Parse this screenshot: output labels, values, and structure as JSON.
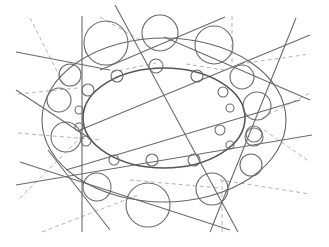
{
  "diagram": {
    "title": "",
    "inner_ellipse": {
      "cx": 164,
      "cy": 118,
      "rx": 81,
      "ry": 50
    },
    "outer_ellipse": {
      "cx": 164,
      "cy": 120,
      "rx": 122,
      "ry": 82
    },
    "solid_lines": [
      {
        "x1": 82,
        "y1": 16,
        "x2": 82,
        "y2": 232
      },
      {
        "x1": 16,
        "y1": 52,
        "x2": 110,
        "y2": 70
      },
      {
        "x1": 16,
        "y1": 90,
        "x2": 92,
        "y2": 140
      },
      {
        "x1": 16,
        "y1": 185,
        "x2": 312,
        "y2": 135
      },
      {
        "x1": 48,
        "y1": 150,
        "x2": 110,
        "y2": 230
      },
      {
        "x1": 100,
        "y1": 70,
        "x2": 225,
        "y2": 17
      },
      {
        "x1": 80,
        "y1": 130,
        "x2": 310,
        "y2": 35
      },
      {
        "x1": 66,
        "y1": 170,
        "x2": 300,
        "y2": 100
      },
      {
        "x1": 115,
        "y1": 5,
        "x2": 238,
        "y2": 232
      },
      {
        "x1": 210,
        "y1": 232,
        "x2": 296,
        "y2": 18
      },
      {
        "x1": 20,
        "y1": 162,
        "x2": 230,
        "y2": 230
      },
      {
        "x1": 164,
        "y1": 37,
        "x2": 310,
        "y2": 100
      }
    ],
    "dashed_lines": [
      {
        "x1": 30,
        "y1": 18,
        "x2": 64,
        "y2": 85
      },
      {
        "x1": 18,
        "y1": 94,
        "x2": 78,
        "y2": 88
      },
      {
        "x1": 100,
        "y1": 17,
        "x2": 140,
        "y2": 40
      },
      {
        "x1": 232,
        "y1": 16,
        "x2": 232,
        "y2": 62
      },
      {
        "x1": 240,
        "y1": 64,
        "x2": 310,
        "y2": 54
      },
      {
        "x1": 262,
        "y1": 118,
        "x2": 310,
        "y2": 93
      },
      {
        "x1": 82,
        "y1": 136,
        "x2": 18,
        "y2": 200
      },
      {
        "x1": 18,
        "y1": 133,
        "x2": 100,
        "y2": 140
      },
      {
        "x1": 42,
        "y1": 232,
        "x2": 138,
        "y2": 195
      },
      {
        "x1": 220,
        "y1": 180,
        "x2": 310,
        "y2": 194
      },
      {
        "x1": 222,
        "y1": 232,
        "x2": 222,
        "y2": 180
      },
      {
        "x1": 264,
        "y1": 130,
        "x2": 310,
        "y2": 162
      },
      {
        "x1": 130,
        "y1": 180,
        "x2": 220,
        "y2": 188
      },
      {
        "x1": 112,
        "y1": 72,
        "x2": 156,
        "y2": 63
      },
      {
        "x1": 186,
        "y1": 64,
        "x2": 224,
        "y2": 70
      }
    ],
    "circles": [
      {
        "cx": 106,
        "cy": 43,
        "r": 22
      },
      {
        "cx": 160,
        "cy": 33,
        "r": 18
      },
      {
        "cx": 214,
        "cy": 45,
        "r": 19
      },
      {
        "cx": 70,
        "cy": 75,
        "r": 11
      },
      {
        "cx": 59,
        "cy": 100,
        "r": 12
      },
      {
        "cx": 117,
        "cy": 76,
        "r": 6
      },
      {
        "cx": 156,
        "cy": 66,
        "r": 7
      },
      {
        "cx": 197,
        "cy": 76,
        "r": 6
      },
      {
        "cx": 88,
        "cy": 90,
        "r": 6
      },
      {
        "cx": 79,
        "cy": 110,
        "r": 4
      },
      {
        "cx": 242,
        "cy": 77,
        "r": 12
      },
      {
        "cx": 257,
        "cy": 106,
        "r": 14
      },
      {
        "cx": 223,
        "cy": 92,
        "r": 5
      },
      {
        "cx": 230,
        "cy": 108,
        "r": 4
      },
      {
        "cx": 79,
        "cy": 127,
        "r": 4
      },
      {
        "cx": 86,
        "cy": 141,
        "r": 5
      },
      {
        "cx": 66,
        "cy": 137,
        "r": 15
      },
      {
        "cx": 97,
        "cy": 187,
        "r": 14
      },
      {
        "cx": 152,
        "cy": 160,
        "r": 6
      },
      {
        "cx": 114,
        "cy": 160,
        "r": 5
      },
      {
        "cx": 194,
        "cy": 160,
        "r": 6
      },
      {
        "cx": 148,
        "cy": 205,
        "r": 22
      },
      {
        "cx": 212,
        "cy": 189,
        "r": 16
      },
      {
        "cx": 251,
        "cy": 165,
        "r": 11
      },
      {
        "cx": 254,
        "cy": 137,
        "r": 9
      },
      {
        "cx": 220,
        "cy": 130,
        "r": 5
      },
      {
        "cx": 230,
        "cy": 145,
        "r": 4
      },
      {
        "cx": 254,
        "cy": 134,
        "r": 8
      }
    ]
  }
}
